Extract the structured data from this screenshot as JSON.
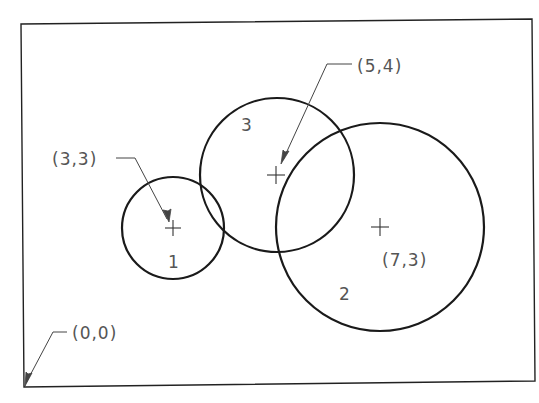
{
  "diagram": {
    "title": "",
    "frame": {
      "x1": 22,
      "y1": 22,
      "x2": 533,
      "y2": 385
    },
    "circles": [
      {
        "id": "1",
        "label": "1",
        "center_label": "(3,3)",
        "cx": 173,
        "cy": 228,
        "r": 51,
        "label_x": 168,
        "label_y": 268
      },
      {
        "id": "2",
        "label": "2",
        "center_label": "(7,3)",
        "cx": 380,
        "cy": 227,
        "r": 104,
        "label_x": 339,
        "label_y": 300
      },
      {
        "id": "3",
        "label": "3",
        "center_label": "(5,4)",
        "cx": 277,
        "cy": 175,
        "r": 77,
        "label_x": 241,
        "label_y": 131
      }
    ],
    "annotations": [
      {
        "id": "origin",
        "text": "(0,0)",
        "x": 72,
        "y": 339
      },
      {
        "id": "c1",
        "text": "(3,3)",
        "x": 52,
        "y": 165
      },
      {
        "id": "c3",
        "text": "(5,4)",
        "x": 357,
        "y": 72
      },
      {
        "id": "c2",
        "text": "(7,3)",
        "x": 382,
        "y": 266
      }
    ],
    "colors": {
      "line": "#1a1a1a",
      "text": "#555555",
      "background": "#ffffff"
    }
  }
}
